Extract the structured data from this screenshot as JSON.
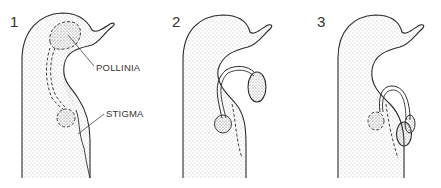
{
  "figure": {
    "panels": [
      {
        "number": "1",
        "stage": "pollinia-in-anther"
      },
      {
        "number": "2",
        "stage": "pollinium-removed"
      },
      {
        "number": "3",
        "stage": "pollinia-on-stigma"
      }
    ],
    "labels": {
      "pollinia": "POLLINIA",
      "stigma": "STIGMA"
    },
    "colors": {
      "line": "#2b2b2b",
      "stipple": "#6e6e6e",
      "background": "#ffffff"
    }
  }
}
